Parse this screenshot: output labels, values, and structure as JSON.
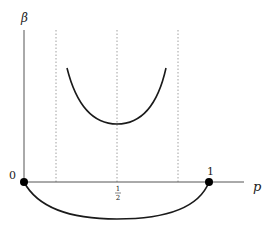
{
  "diagram": {
    "axes": {
      "y_label": "β",
      "x_label": "p"
    },
    "ticks": {
      "origin": "0",
      "half_num": "1",
      "half_den": "2",
      "one": "1"
    },
    "colors": {
      "curve": "#1a1a1a",
      "axis": "#555555",
      "dotted": "#888888",
      "point": "#000000"
    }
  }
}
